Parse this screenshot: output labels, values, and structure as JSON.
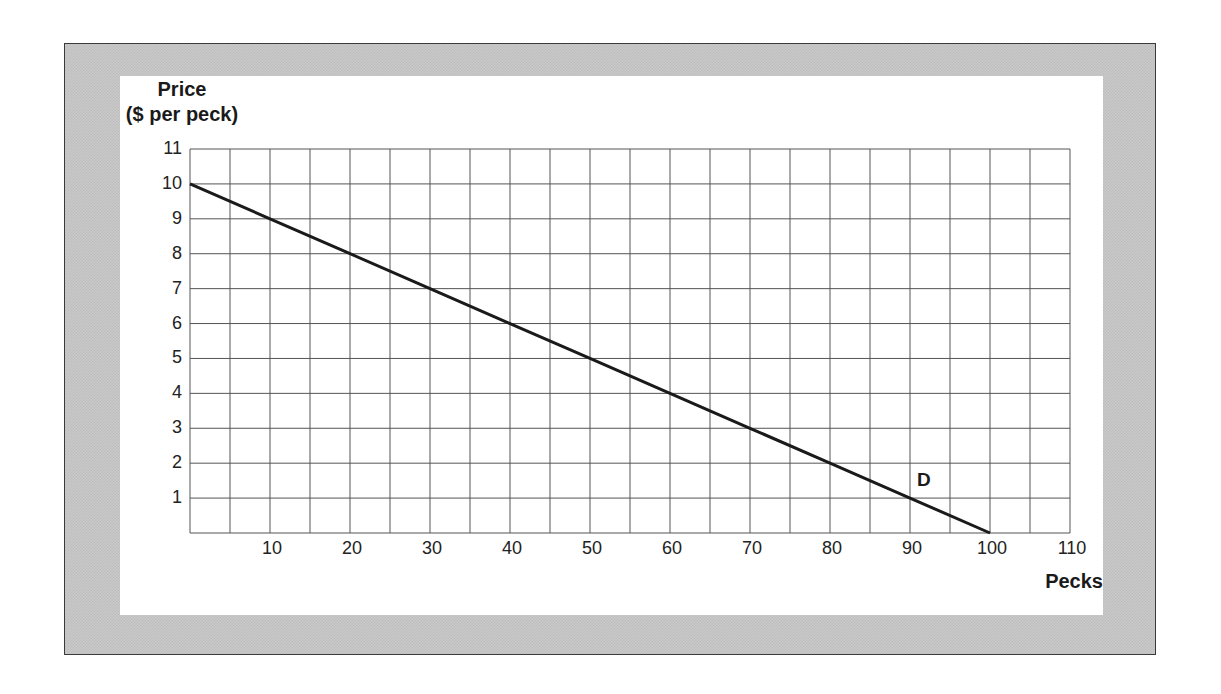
{
  "chart_data": {
    "type": "line",
    "title": "",
    "xlabel": "Pecks",
    "ylabel": "Price ($ per peck)",
    "ylabel_lines": [
      "Price",
      "($ per peck)"
    ],
    "xlim": [
      0,
      110
    ],
    "ylim": [
      0,
      11
    ],
    "x_ticks": [
      10,
      20,
      30,
      40,
      50,
      60,
      70,
      80,
      90,
      100,
      110
    ],
    "y_ticks": [
      1,
      2,
      3,
      4,
      5,
      6,
      7,
      8,
      9,
      10,
      11
    ],
    "x_grid_step": 5,
    "y_grid_step": 1,
    "grid": true,
    "series": [
      {
        "name": "D",
        "label": "D",
        "x": [
          0,
          10,
          20,
          30,
          40,
          50,
          60,
          70,
          80,
          90,
          100
        ],
        "y": [
          10,
          9,
          8,
          7,
          6,
          5,
          4,
          3,
          2,
          1,
          0
        ]
      }
    ],
    "annotations": [
      {
        "text": "D",
        "x": 92,
        "y": 1.5
      }
    ],
    "colors": {
      "line": "#1a1a1a",
      "grid": "#555555",
      "frame": "#c9c9c9",
      "panel": "#ffffff"
    }
  },
  "labels": {
    "y_title_line1": "Price",
    "y_title_line2": "($ per peck)",
    "x_title": "Pecks",
    "curve": "D",
    "y_ticks": [
      "1",
      "2",
      "3",
      "4",
      "5",
      "6",
      "7",
      "8",
      "9",
      "10",
      "11"
    ],
    "x_ticks": [
      "10",
      "20",
      "30",
      "40",
      "50",
      "60",
      "70",
      "80",
      "90",
      "100",
      "110"
    ]
  }
}
